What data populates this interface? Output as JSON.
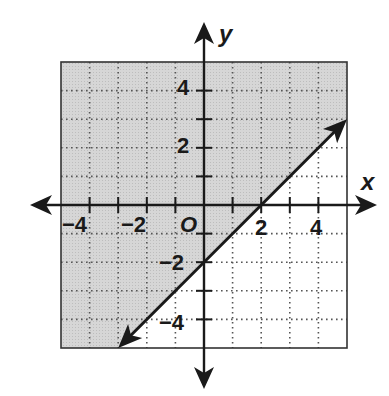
{
  "chart_data": {
    "type": "line",
    "title": "",
    "xlabel": "x",
    "ylabel": "y",
    "origin_label": "O",
    "xlim": [
      -5,
      5
    ],
    "ylim": [
      -5,
      5
    ],
    "grid": true,
    "grid_style": "dotted",
    "x_ticks": [
      -4,
      -3,
      -2,
      -1,
      1,
      2,
      3,
      4
    ],
    "y_ticks": [
      -4,
      -3,
      -2,
      -1,
      1,
      2,
      3,
      4
    ],
    "x_tick_labels": [
      "−4",
      "−2",
      "2",
      "4"
    ],
    "y_tick_labels": [
      "4",
      "2",
      "−2",
      "−4"
    ],
    "series": [
      {
        "name": "boundary line",
        "equation": "y = x - 2",
        "style": "solid",
        "arrows": "both",
        "points": [
          [
            -3,
            -5
          ],
          [
            0,
            -2
          ],
          [
            2,
            0
          ],
          [
            5,
            3
          ]
        ]
      }
    ],
    "shaded_region": {
      "description": "half-plane above the line (y ≥ x − 2)",
      "polygon": [
        [
          -5,
          5
        ],
        [
          5,
          5
        ],
        [
          5,
          3
        ],
        [
          -3,
          -5
        ],
        [
          -5,
          -5
        ]
      ]
    }
  },
  "colors": {
    "shade": "#d4d4d4",
    "ink": "#1a1a1a",
    "background": "#ffffff"
  }
}
